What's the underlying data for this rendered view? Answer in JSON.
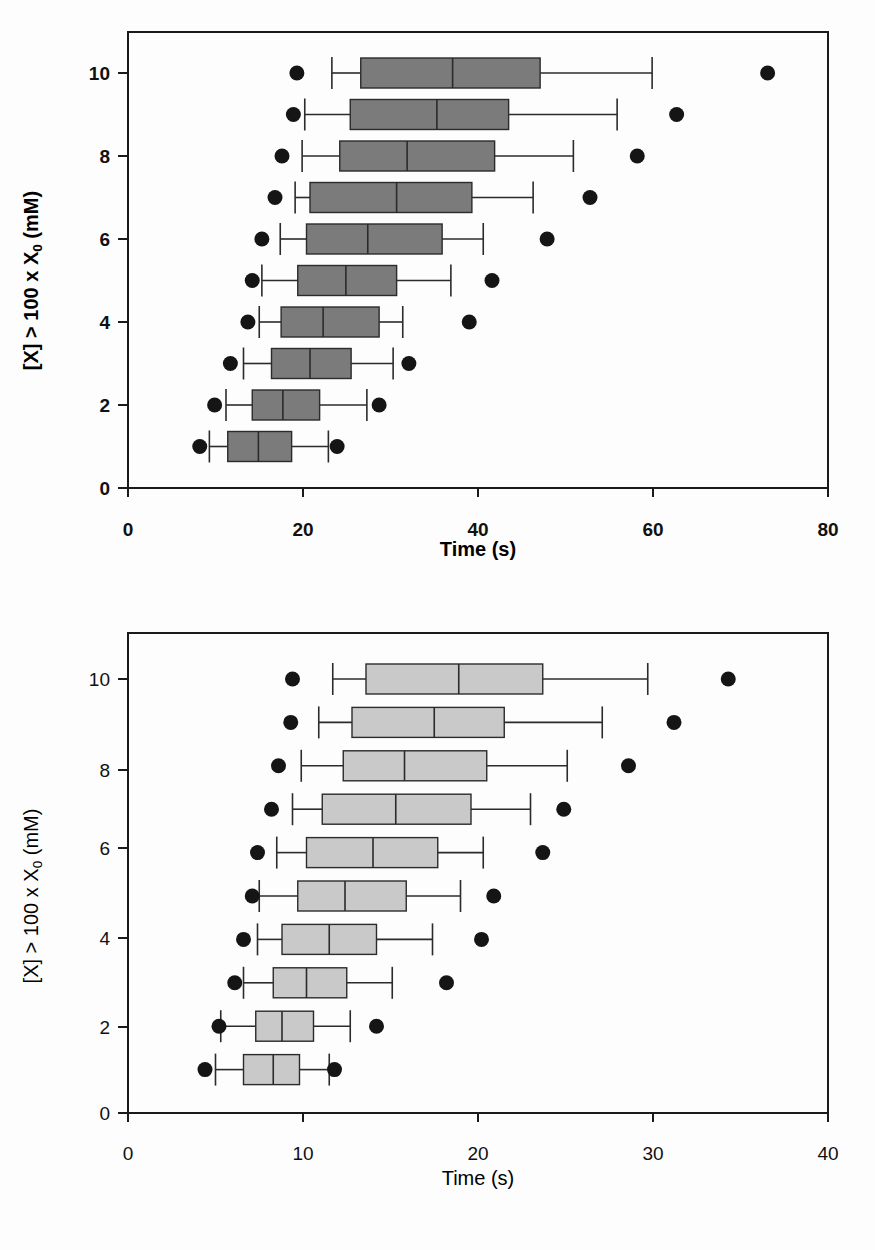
{
  "figure": {
    "background_color": "#fdfdfd",
    "panels": [
      "top",
      "bottom"
    ]
  },
  "chart_data": [
    {
      "id": "top",
      "type": "box",
      "orientation": "horizontal",
      "title": "",
      "xlabel": "Time (s)",
      "ylabel": "[X] > 100 x X0 (mM)",
      "ylabel_parts": {
        "prefix": "[X] > 100 x X",
        "subscript": "0",
        "suffix": " (mM)"
      },
      "xlim": [
        0,
        80
      ],
      "ylim": [
        0,
        11
      ],
      "xticks": [
        0,
        20,
        40,
        60,
        80
      ],
      "xticklabels": [
        "0",
        "20",
        "40",
        "60",
        "80"
      ],
      "yticks": [
        0,
        2,
        4,
        6,
        8,
        10
      ],
      "yticklabels": [
        "0",
        "2",
        "4",
        "6",
        "8",
        "10"
      ],
      "grid": false,
      "legend": "none",
      "box_fill": "#7b7b7b",
      "box_edge": "#2b2b2b",
      "outlier_color": "#151515",
      "categories": [
        1,
        2,
        3,
        4,
        5,
        6,
        7,
        8,
        9,
        10
      ],
      "boxes": [
        {
          "category": 1,
          "whisker_low": 9.3,
          "q1": 11.4,
          "median": 14.9,
          "q3": 18.7,
          "whisker_high": 22.9,
          "outliers": [
            8.2,
            23.9
          ]
        },
        {
          "category": 2,
          "whisker_low": 11.2,
          "q1": 14.2,
          "median": 17.7,
          "q3": 21.9,
          "whisker_high": 27.3,
          "outliers": [
            9.9,
            28.7
          ]
        },
        {
          "category": 3,
          "whisker_low": 13.2,
          "q1": 16.4,
          "median": 20.8,
          "q3": 25.5,
          "whisker_high": 30.3,
          "outliers": [
            11.7,
            32.1
          ]
        },
        {
          "category": 4,
          "whisker_low": 15.0,
          "q1": 17.5,
          "median": 22.3,
          "q3": 28.7,
          "whisker_high": 31.4,
          "outliers": [
            13.7,
            39.0
          ]
        },
        {
          "category": 5,
          "whisker_low": 15.3,
          "q1": 19.4,
          "median": 24.9,
          "q3": 30.7,
          "whisker_high": 36.9,
          "outliers": [
            14.2,
            41.6
          ]
        },
        {
          "category": 6,
          "whisker_low": 17.4,
          "q1": 20.4,
          "median": 27.4,
          "q3": 35.9,
          "whisker_high": 40.6,
          "outliers": [
            15.3,
            47.9
          ]
        },
        {
          "category": 7,
          "whisker_low": 19.1,
          "q1": 20.8,
          "median": 30.7,
          "q3": 39.3,
          "whisker_high": 46.3,
          "outliers": [
            16.8,
            52.8
          ]
        },
        {
          "category": 8,
          "whisker_low": 19.9,
          "q1": 24.2,
          "median": 31.9,
          "q3": 41.9,
          "whisker_high": 50.9,
          "outliers": [
            17.6,
            58.2
          ]
        },
        {
          "category": 9,
          "whisker_low": 20.2,
          "q1": 25.4,
          "median": 35.3,
          "q3": 43.5,
          "whisker_high": 55.9,
          "outliers": [
            18.9,
            62.7
          ]
        },
        {
          "category": 10,
          "whisker_low": 23.3,
          "q1": 26.6,
          "median": 37.1,
          "q3": 47.1,
          "whisker_high": 59.9,
          "outliers": [
            19.3,
            73.1
          ]
        }
      ]
    },
    {
      "id": "bottom",
      "type": "box",
      "orientation": "horizontal",
      "title": "",
      "xlabel": "Time (s)",
      "ylabel": "[X] > 100 x X0 (mM)",
      "ylabel_parts": {
        "prefix": "[X] > 100 x X",
        "subscript": "0",
        "suffix": " (mM)"
      },
      "xlim": [
        0,
        40
      ],
      "ylim": [
        0,
        11
      ],
      "xticks": [
        0,
        10,
        20,
        30,
        40
      ],
      "xticklabels": [
        "0",
        "10",
        "20",
        "30",
        "40"
      ],
      "yticks": [
        0,
        2,
        4,
        6,
        8,
        10
      ],
      "yticklabels": [
        "0",
        "2",
        "4",
        "6",
        "8",
        "10"
      ],
      "grid": false,
      "legend": "none",
      "box_fill": "#c9c9c9",
      "box_edge": "#2b2b2b",
      "outlier_color": "#151515",
      "categories": [
        1,
        2,
        3,
        4,
        5,
        6,
        7,
        8,
        9,
        10
      ],
      "boxes": [
        {
          "category": 1,
          "whisker_low": 5.0,
          "q1": 6.6,
          "median": 8.3,
          "q3": 9.8,
          "whisker_high": 11.5,
          "outliers": [
            4.4,
            11.8
          ]
        },
        {
          "category": 2,
          "whisker_low": 5.3,
          "q1": 7.3,
          "median": 8.8,
          "q3": 10.6,
          "whisker_high": 12.7,
          "outliers": [
            5.2,
            14.2
          ]
        },
        {
          "category": 3,
          "whisker_low": 6.6,
          "q1": 8.3,
          "median": 10.2,
          "q3": 12.5,
          "whisker_high": 15.1,
          "outliers": [
            6.1,
            18.2
          ]
        },
        {
          "category": 4,
          "whisker_low": 7.4,
          "q1": 8.8,
          "median": 11.5,
          "q3": 14.2,
          "whisker_high": 17.4,
          "outliers": [
            6.6,
            20.2
          ]
        },
        {
          "category": 5,
          "whisker_low": 7.5,
          "q1": 9.7,
          "median": 12.4,
          "q3": 15.9,
          "whisker_high": 19.0,
          "outliers": [
            7.1,
            20.9
          ]
        },
        {
          "category": 6,
          "whisker_low": 8.5,
          "q1": 10.2,
          "median": 14.0,
          "q3": 17.7,
          "whisker_high": 20.3,
          "outliers": [
            7.4,
            23.7
          ]
        },
        {
          "category": 7,
          "whisker_low": 9.4,
          "q1": 11.1,
          "median": 15.3,
          "q3": 19.6,
          "whisker_high": 23.0,
          "outliers": [
            8.2,
            24.9
          ]
        },
        {
          "category": 8,
          "whisker_low": 9.9,
          "q1": 12.3,
          "median": 15.8,
          "q3": 20.5,
          "whisker_high": 25.1,
          "outliers": [
            8.6,
            28.6
          ]
        },
        {
          "category": 9,
          "whisker_low": 10.9,
          "q1": 12.8,
          "median": 17.5,
          "q3": 21.5,
          "whisker_high": 27.1,
          "outliers": [
            9.3,
            31.2
          ]
        },
        {
          "category": 10,
          "whisker_low": 11.7,
          "q1": 13.6,
          "median": 18.9,
          "q3": 23.7,
          "whisker_high": 29.7,
          "outliers": [
            9.4,
            34.3
          ]
        }
      ]
    }
  ]
}
